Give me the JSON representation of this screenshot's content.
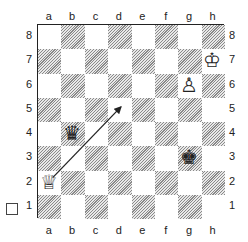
{
  "diagram": {
    "files": [
      "a",
      "b",
      "c",
      "d",
      "e",
      "f",
      "g",
      "h"
    ],
    "ranks": [
      "8",
      "7",
      "6",
      "5",
      "4",
      "3",
      "2",
      "1"
    ],
    "pieces": [
      {
        "square": "h7",
        "piece": "white-king",
        "glyph": "♔"
      },
      {
        "square": "g6",
        "piece": "white-pawn",
        "glyph": "♙"
      },
      {
        "square": "b4",
        "piece": "black-queen",
        "glyph": "♛"
      },
      {
        "square": "a2",
        "piece": "white-queen",
        "glyph": "♕"
      },
      {
        "square": "g3",
        "piece": "black-king",
        "glyph": "♚"
      }
    ],
    "arrow": {
      "from": "a2",
      "to": "d5"
    },
    "side_to_move_marker": "white-to-move-checkbox"
  }
}
